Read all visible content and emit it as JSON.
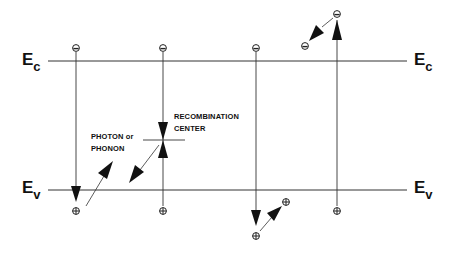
{
  "diagram": {
    "title": "",
    "bands": {
      "conduction": {
        "symbol": "E",
        "subscript": "c"
      },
      "valence": {
        "symbol": "E",
        "subscript": "v"
      }
    },
    "annotations": {
      "recombination_line1": "RECOMBINATION",
      "recombination_line2": "CENTER",
      "photon_line1": "PHOTON or",
      "photon_line2": "PHONON"
    },
    "carriers": {
      "electron_symbol": "⊖",
      "hole_symbol": "⊕"
    },
    "processes": [
      {
        "name": "band-to-band recombination with photon/phonon emission"
      },
      {
        "name": "recombination via recombination center"
      },
      {
        "name": "hole relaxation (Auger-type) below valence band"
      },
      {
        "name": "electron relaxation (Auger-type) above conduction band"
      }
    ],
    "colors": {
      "line": "#222222",
      "background": "#ffffff"
    }
  }
}
